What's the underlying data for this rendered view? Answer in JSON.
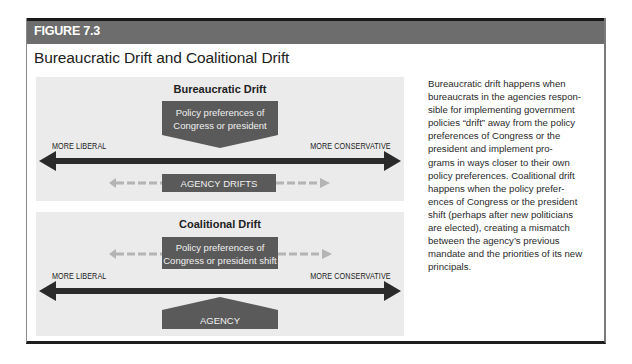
{
  "figure": {
    "label": "FIGURE 7.3",
    "title": "Bureaucratic Drift and Coalitional Drift"
  },
  "colors": {
    "header_bg": "#6d6d6d",
    "panel_bg": "#ebebeb",
    "dark_shape": "#5a5a5a",
    "axis_arrow": "#2a2a2a",
    "dashed_arrow": "#b4b4b4"
  },
  "panels": [
    {
      "title": "Bureaucratic Drift",
      "top_box_lines": [
        "Policy preferences of",
        "Congress or president"
      ],
      "axis_left": "MORE LIBERAL",
      "axis_right": "MORE CONSERVATIVE",
      "bottom_box": "AGENCY DRIFTS"
    },
    {
      "title": "Coalitional Drift",
      "top_box_lines": [
        "Policy preferences of",
        "Congress or president shift"
      ],
      "axis_left": "MORE LIBERAL",
      "axis_right": "MORE CONSERVATIVE",
      "bottom_box": "AGENCY"
    }
  ],
  "description_lines": [
    "Bureaucratic drift happens when",
    "bureaucrats in the agencies respon-",
    "sible for implementing government",
    "policies “drift” away from the policy",
    "preferences of Congress or the",
    "president and implement pro-",
    "grams in ways closer to their own",
    "policy preferences. Coalitional drift",
    "happens when the policy prefer-",
    "ences of Congress or the president",
    "shift (perhaps after new politicians",
    "are elected), creating a mismatch",
    "between the agency’s previous",
    "mandate and the priorities of its new",
    "principals."
  ]
}
